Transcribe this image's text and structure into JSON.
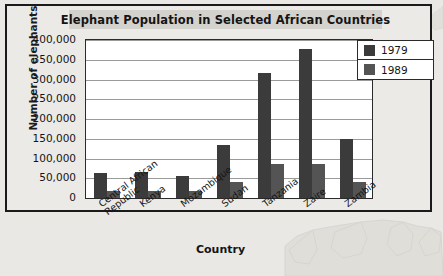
{
  "chart_data": {
    "type": "bar",
    "title": "Elephant Population in Selected African Countries",
    "xlabel": "Country",
    "ylabel": "Number of elephants",
    "categories": [
      "Central African Republic",
      "Kenya",
      "Mozambique",
      "Sudan",
      "Tanzania",
      "Zaire",
      "Zambia"
    ],
    "category_lines": [
      [
        "Central African",
        "Republic"
      ],
      [
        "Kenya"
      ],
      [
        "Mozambique"
      ],
      [
        "Sudan"
      ],
      [
        "Tanzania"
      ],
      [
        "Zaire"
      ],
      [
        "Zambia"
      ]
    ],
    "series": [
      {
        "name": "1979",
        "color": "#3b3b3b",
        "values": [
          63000,
          65000,
          55000,
          134000,
          316000,
          377000,
          150000
        ]
      },
      {
        "name": "1989",
        "color": "#545454",
        "values": [
          19000,
          19000,
          18000,
          40000,
          85000,
          85000,
          41000
        ]
      }
    ],
    "ylim": [
      0,
      400000
    ],
    "ytick_step": 50000,
    "ytick_labels": [
      "400,000",
      "350,000",
      "300,000",
      "250,000",
      "200,000",
      "150,000",
      "100,000",
      "50,000",
      "0"
    ],
    "ytick_values": [
      400000,
      350000,
      300000,
      250000,
      200000,
      150000,
      100000,
      50000,
      0
    ],
    "grid": true,
    "legend_position": "top-right",
    "legend_entries": [
      "1979",
      "1989"
    ]
  },
  "colors": {
    "page_background": "#e9e8e4",
    "frame": "#1a1a1a",
    "plot_background": "#ffffff",
    "gridline": "#9a9a9a",
    "series_1979": "#3b3b3b",
    "series_1989": "#545454",
    "title_band": "#d4d2cd"
  }
}
